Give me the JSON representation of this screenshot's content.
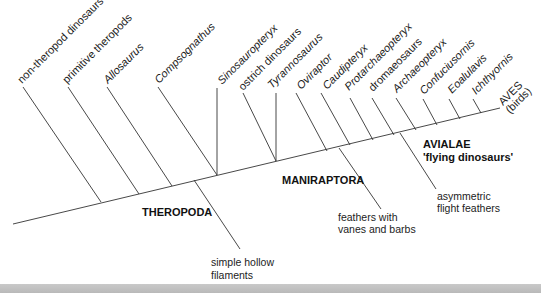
{
  "diagram": {
    "type": "cladogram",
    "colors": {
      "line": "#333333",
      "text": "#1a1a1a",
      "strip": "#c2c2c2"
    },
    "taxa": [
      {
        "label": "non-theropod dinosaurs",
        "italic": false
      },
      {
        "label": "primitive theropods",
        "italic": false
      },
      {
        "label": "Allosaurus",
        "italic": true
      },
      {
        "label": "Compsognathus",
        "italic": true
      },
      {
        "label": "Sinosauropteryx",
        "italic": true
      },
      {
        "label": "ostrich dinosaurs",
        "italic": false
      },
      {
        "label": "Tyrannosaurus",
        "italic": true
      },
      {
        "label": "Oviraptor",
        "italic": true
      },
      {
        "label": "Caudipteryx",
        "italic": true
      },
      {
        "label": "Protarchaeopteryx",
        "italic": true
      },
      {
        "label": "dromaeosaurs",
        "italic": false
      },
      {
        "label": "Archaeopteryx",
        "italic": true
      },
      {
        "label": "Confuciusornis",
        "italic": true
      },
      {
        "label": "Eoalulavis",
        "italic": true
      },
      {
        "label": "Ichthyornis",
        "italic": true
      }
    ],
    "terminal": {
      "line1": "AVES",
      "line2": "(birds)"
    },
    "clades": [
      {
        "label": "THEROPODA"
      },
      {
        "label": "MANIRAPTORA"
      },
      {
        "label": "AVIALAE",
        "sublabel": "'flying dinosaurs'"
      }
    ],
    "characters": [
      {
        "line1": "simple hollow",
        "line2": "filaments"
      },
      {
        "line1": "feathers with",
        "line2": "vanes and barbs"
      },
      {
        "line1": "asymmetric",
        "line2": "flight feathers"
      }
    ]
  }
}
